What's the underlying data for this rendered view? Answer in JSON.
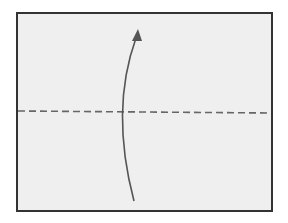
{
  "diagram": {
    "type": "origami-fold-step",
    "paper": {
      "x": 17,
      "y": 13,
      "width": 255,
      "height": 198,
      "fill": "#efefef",
      "stroke": "#333333"
    },
    "fold_line": {
      "style": "valley-fold-dashed",
      "y_left": 111,
      "y_right": 113,
      "color": "#666666"
    },
    "arrow": {
      "direction": "up",
      "meaning": "fold bottom edge up to top",
      "start": [
        134,
        201
      ],
      "end": [
        137,
        33
      ],
      "color": "#555555"
    },
    "colors": {
      "background": "#ffffff",
      "paper": "#efefef",
      "border": "#333333",
      "dash": "#666666",
      "arrow": "#555555"
    }
  }
}
